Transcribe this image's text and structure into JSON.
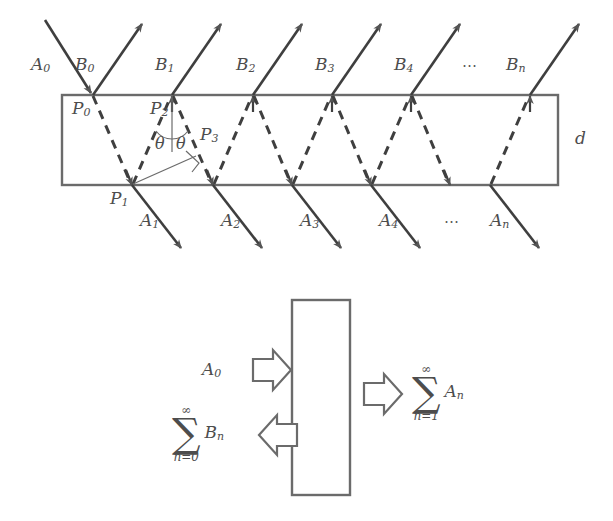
{
  "figure": {
    "stroke_color": "#555555",
    "label_color": "#4d4d4d",
    "background_color": "#ffffff"
  },
  "top_diagram": {
    "name": "ray-trace-diagram",
    "slab": {
      "x": 62,
      "y": 95,
      "width": 496,
      "height": 90,
      "thickness_label": "d"
    },
    "incident_ray": {
      "label": "A0",
      "label_html": "A<sub>0</sub>",
      "x1": 47,
      "y1": 22,
      "x2": 97,
      "y2": 97
    },
    "points": [
      {
        "label": "P0",
        "label_html": "P<sub>0</sub>",
        "x": 93,
        "y": 95
      },
      {
        "label": "P1",
        "label_html": "P<sub>1</sub>",
        "x": 132,
        "y": 185
      },
      {
        "label": "P2",
        "label_html": "P<sub>2</sub>",
        "x": 172,
        "y": 95
      },
      {
        "label": "P3",
        "label_html": "P<sub>3</sub>",
        "x": 213,
        "y": 185
      }
    ],
    "angles": [
      {
        "label": "θ",
        "side": "left"
      },
      {
        "label": "θ",
        "side": "right"
      }
    ],
    "reflected_rays_B": [
      {
        "label": "B0",
        "label_html": "B<sub>0</sub>",
        "base_x": 93
      },
      {
        "label": "B1",
        "label_html": "B<sub>1</sub>",
        "base_x": 172
      },
      {
        "label": "B2",
        "label_html": "B<sub>2</sub>",
        "base_x": 253
      },
      {
        "label": "B3",
        "label_html": "B<sub>3</sub>",
        "base_x": 332
      },
      {
        "label": "B4",
        "label_html": "B<sub>4</sub>",
        "base_x": 411
      },
      {
        "label": "Bn",
        "label_html": "B<sub>n</sub>",
        "base_x": 530
      }
    ],
    "transmitted_rays_A": [
      {
        "label": "A1",
        "label_html": "A<sub>1</sub>",
        "base_x": 132
      },
      {
        "label": "A2",
        "label_html": "A<sub>2</sub>",
        "base_x": 213
      },
      {
        "label": "A3",
        "label_html": "A<sub>3</sub>",
        "base_x": 292
      },
      {
        "label": "A4",
        "label_html": "A<sub>4</sub>",
        "base_x": 371
      },
      {
        "label": "An",
        "label_html": "A<sub>n</sub>",
        "base_x": 490
      }
    ],
    "ellipsis_top": "⋯",
    "ellipsis_bottom": "⋯"
  },
  "bottom_diagram": {
    "name": "summary-block-diagram",
    "slab": {
      "x": 292,
      "y": 300,
      "width": 58,
      "height": 195
    },
    "input": {
      "label": "A0",
      "label_html": "A<sub>0</sub>",
      "arrow_direction": "right"
    },
    "reflected_sum": {
      "upper_limit": "∞",
      "sigma": "∑",
      "lower_limit": "n=0",
      "term": "Bn",
      "term_html": "B<sub>n</sub>",
      "arrow_direction": "left"
    },
    "transmitted_sum": {
      "upper_limit": "∞",
      "sigma": "∑",
      "lower_limit": "n=1",
      "term": "An",
      "term_html": "A<sub>n</sub>",
      "arrow_direction": "right"
    }
  }
}
